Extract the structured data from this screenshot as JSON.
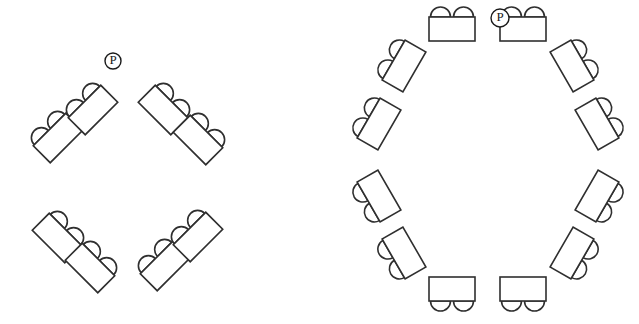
{
  "page": {
    "background_color": "#ffffff",
    "line_color": "#2f2f2f",
    "width": 639,
    "height": 324
  },
  "marker": {
    "label": "P",
    "shape": "circle",
    "description": "circled P marker"
  },
  "table_unit": {
    "table_width": 46,
    "table_height": 24,
    "chair_count": 2,
    "chair_radius": 10,
    "chair_shape": "semicircle"
  },
  "diagrams": [
    {
      "id": "diamond-layout",
      "name": "Eight table diamond arrangement",
      "center_x": 122,
      "center_y": 192,
      "table_count": 8,
      "seat_count": 16,
      "marker": {
        "x": 113,
        "y": 61,
        "radius": 8,
        "label": "P"
      },
      "tables": [
        {
          "id": "d1",
          "x": 58,
          "y": 138,
          "rotation": -45,
          "seats": 2
        },
        {
          "id": "d2",
          "x": 93,
          "y": 110,
          "rotation": -45,
          "seats": 2
        },
        {
          "id": "d3",
          "x": 163,
          "y": 110,
          "rotation": 45,
          "seats": 2
        },
        {
          "id": "d4",
          "x": 198,
          "y": 140,
          "rotation": 45,
          "seats": 2
        },
        {
          "id": "d5",
          "x": 57,
          "y": 238,
          "rotation": 45,
          "seats": 2
        },
        {
          "id": "d6",
          "x": 90,
          "y": 268,
          "rotation": 45,
          "seats": 2
        },
        {
          "id": "d7",
          "x": 165,
          "y": 266,
          "rotation": -45,
          "seats": 2
        },
        {
          "id": "d8",
          "x": 198,
          "y": 237,
          "rotation": -45,
          "seats": 2
        }
      ]
    },
    {
      "id": "circle-layout",
      "name": "Twelve table circular arrangement",
      "center_x": 489,
      "center_y": 160,
      "table_count": 12,
      "seat_count": 24,
      "marker": {
        "x": 500,
        "y": 18,
        "radius": 9,
        "label": "P"
      },
      "tables": [
        {
          "id": "c1",
          "x": 452,
          "y": 29,
          "rotation": 0,
          "seats": 2
        },
        {
          "id": "c2",
          "x": 523,
          "y": 29,
          "rotation": 0,
          "seats": 2
        },
        {
          "id": "c3",
          "x": 572,
          "y": 66,
          "rotation": 60,
          "seats": 2
        },
        {
          "id": "c4",
          "x": 597,
          "y": 124,
          "rotation": 60,
          "seats": 2
        },
        {
          "id": "c5",
          "x": 597,
          "y": 196,
          "rotation": 120,
          "seats": 2
        },
        {
          "id": "c6",
          "x": 572,
          "y": 253,
          "rotation": 120,
          "seats": 2
        },
        {
          "id": "c7",
          "x": 523,
          "y": 289,
          "rotation": 180,
          "seats": 2
        },
        {
          "id": "c8",
          "x": 452,
          "y": 289,
          "rotation": 180,
          "seats": 2
        },
        {
          "id": "c9",
          "x": 404,
          "y": 253,
          "rotation": -120,
          "seats": 2
        },
        {
          "id": "c10",
          "x": 379,
          "y": 196,
          "rotation": -120,
          "seats": 2
        },
        {
          "id": "c11",
          "x": 379,
          "y": 124,
          "rotation": -60,
          "seats": 2
        },
        {
          "id": "c12",
          "x": 404,
          "y": 66,
          "rotation": -60,
          "seats": 2
        }
      ]
    }
  ]
}
